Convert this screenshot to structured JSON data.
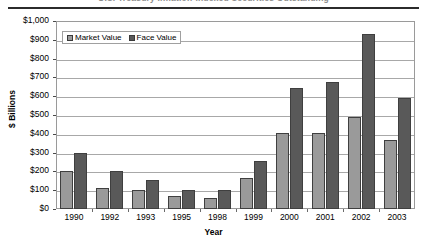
{
  "title": {
    "text": "U.S. Treasury Inflation-Indexed Securities Outstanding",
    "visible_as_clipped_sliver": true
  },
  "axes": {
    "ylabel": "$ Billions",
    "xlabel": "Year",
    "yticks": [
      "$0",
      "$100",
      "$200",
      "$300",
      "$400",
      "$500",
      "$600",
      "$700",
      "$800",
      "$900",
      "$1,000"
    ]
  },
  "legend": {
    "entries": [
      {
        "label": "Market Value",
        "color": "#9a9a9a"
      },
      {
        "label": "Face Value",
        "color": "#595959"
      }
    ]
  },
  "chart_data": {
    "type": "bar",
    "title": "U.S. Treasury Inflation-Indexed Securities Outstanding",
    "xlabel": "Year",
    "ylabel": "$ Billions",
    "ylim": [
      0,
      1000
    ],
    "ytick_step": 100,
    "grid": true,
    "legend_position": "top-left-inside",
    "categories": [
      "1990",
      "1992",
      "1993",
      "1995",
      "1998",
      "1999",
      "2000",
      "2001",
      "2002",
      "2003"
    ],
    "series": [
      {
        "name": "Market Value",
        "color": "#9a9a9a",
        "values": [
          200,
          110,
          100,
          70,
          60,
          165,
          405,
          405,
          490,
          365
        ]
      },
      {
        "name": "Face Value",
        "color": "#595959",
        "values": [
          300,
          200,
          155,
          100,
          100,
          255,
          645,
          675,
          930,
          590
        ]
      }
    ]
  }
}
